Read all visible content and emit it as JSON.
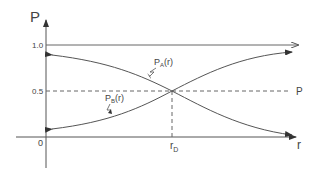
{
  "diagram": {
    "axes": {
      "y_label": "P",
      "x_label": "r",
      "origin_label": "0",
      "y_ticks": [
        "1.0",
        "0.5"
      ],
      "x_tick": "r",
      "x_tick_sub": "D"
    },
    "reference_lines": {
      "upper": "1.0",
      "half": "0.5",
      "half_right_label": "P"
    },
    "curves": [
      {
        "name": "P_A(r)",
        "label_main": "P",
        "label_sub": "A",
        "label_arg": "(r)",
        "trend": "decreasing from ~0.9 to ~0.1"
      },
      {
        "name": "P_B(r)",
        "label_main": "P",
        "label_sub": "B",
        "label_arg": "(r)",
        "trend": "increasing from ~0.1 to ~0.9"
      }
    ],
    "intersection": {
      "x": "r_D",
      "y": "0.5"
    },
    "colors": {
      "line": "#555555",
      "text": "#444444"
    }
  }
}
